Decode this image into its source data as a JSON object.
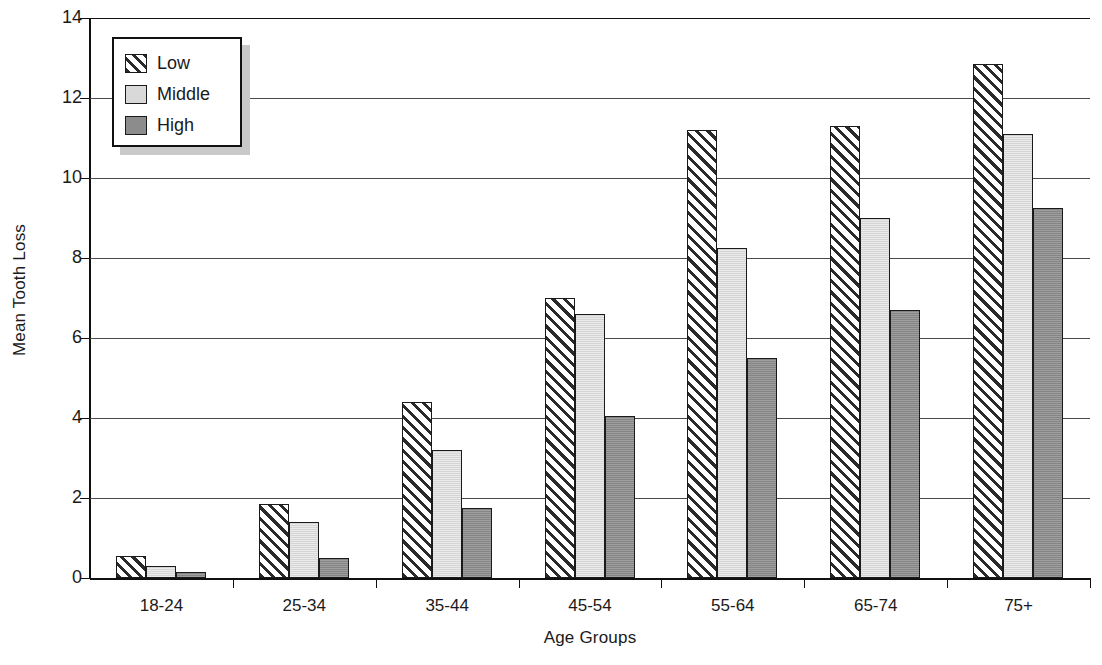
{
  "chart_data": {
    "type": "bar",
    "title": "",
    "xlabel": "Age Groups",
    "ylabel": "Mean Tooth Loss",
    "categories": [
      "18-24",
      "25-34",
      "35-44",
      "45-54",
      "55-64",
      "65-74",
      "75+"
    ],
    "series": [
      {
        "name": "Low",
        "values": [
          0.55,
          1.85,
          4.4,
          7.0,
          11.2,
          11.3,
          12.85
        ]
      },
      {
        "name": "Middle",
        "values": [
          0.3,
          1.4,
          3.2,
          6.6,
          8.25,
          9.0,
          11.1
        ]
      },
      {
        "name": "High",
        "values": [
          0.15,
          0.5,
          1.75,
          4.05,
          5.5,
          6.7,
          9.25
        ]
      }
    ],
    "ylim": [
      0,
      14
    ],
    "yticks": [
      0,
      2,
      4,
      6,
      8,
      10,
      12,
      14
    ],
    "grid": true,
    "legend_position": "top-left",
    "colors": {
      "low": "#ffffff",
      "low_hatch": "#2a2a2a",
      "middle": "#d9d9d9",
      "high": "#8c8c8c",
      "axis": "#111111",
      "gridline": "#4a4a4a",
      "background": "#ffffff"
    }
  },
  "legend": {
    "items": [
      {
        "label": "Low",
        "pattern": "diagonal-hatch"
      },
      {
        "label": "Middle",
        "pattern": "light-gray-fill"
      },
      {
        "label": "High",
        "pattern": "dark-gray-fill"
      }
    ]
  }
}
